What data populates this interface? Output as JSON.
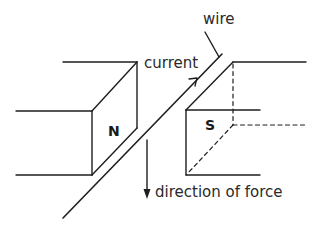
{
  "diagram": {
    "labels": {
      "wire": "wire",
      "current": "current",
      "north_pole": "N",
      "south_pole": "S",
      "force": "direction of force"
    },
    "colors": {
      "line": "#1e1e1e",
      "text": "#2a2a2a",
      "background": "#ffffff"
    }
  }
}
